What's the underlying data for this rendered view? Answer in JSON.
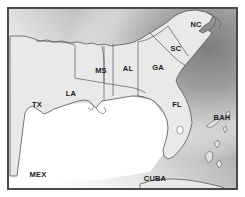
{
  "figure": {
    "kind": "reference-map",
    "width": 245,
    "height": 197
  },
  "colors": {
    "page_background": "#ffffff",
    "frame_border": "#4a4a4a",
    "land_fill": "#e9e9e9",
    "land_outline": "#555555",
    "state_border": "#5a5a5a",
    "gulf_water": "#ffffff",
    "atlantic_deep": "#8d8d8d",
    "atlantic_shallow": "#ffffff",
    "label_text": "#1a1a1a"
  },
  "frame": {
    "x": 8,
    "y": 8,
    "width": 229,
    "height": 181,
    "stroke_width": 2
  },
  "labels": [
    {
      "id": "label-nc",
      "text": "NC",
      "x": 196,
      "y": 27,
      "size": 7.5
    },
    {
      "id": "label-sc",
      "text": "SC",
      "x": 176,
      "y": 51,
      "size": 7.5
    },
    {
      "id": "label-ms",
      "text": "MS",
      "x": 101,
      "y": 73,
      "size": 7.5
    },
    {
      "id": "label-al",
      "text": "AL",
      "x": 128,
      "y": 71,
      "size": 7.5
    },
    {
      "id": "label-ga",
      "text": "GA",
      "x": 158,
      "y": 70,
      "size": 7.5
    },
    {
      "id": "label-la",
      "text": "LA",
      "x": 71,
      "y": 96,
      "size": 7.5
    },
    {
      "id": "label-tx",
      "text": "TX",
      "x": 37,
      "y": 107,
      "size": 7.5
    },
    {
      "id": "label-fl",
      "text": "FL",
      "x": 177,
      "y": 107,
      "size": 7.5
    },
    {
      "id": "label-bah",
      "text": "BAH",
      "x": 222,
      "y": 120,
      "size": 7.5
    },
    {
      "id": "label-mex",
      "text": "MEX",
      "x": 38,
      "y": 177,
      "size": 7.5
    },
    {
      "id": "label-cuba",
      "text": "CUBA",
      "x": 155,
      "y": 181,
      "size": 7.5
    }
  ],
  "regions": {
    "mainland_outline": "M 10 36 L 24 36 L 32 38 L 40 41 L 47 40 L 54 42 L 62 41 L 70 43 L 78 42 L 86 44 L 92 43 L 98 45 L 104 44 L 112 46 L 118 45 L 126 44 L 134 42 L 142 38 L 150 33 L 158 28 L 166 23 L 172 18 L 178 14 L 186 11 L 196 10 L 206 12 L 213 16 L 210 22 L 204 26 L 199 31 L 203 33 L 208 30 L 212 33 L 208 38 L 203 44 L 198 50 L 193 56 L 188 62 L 183 68 L 179 74 L 176 80 L 178 86 L 182 92 L 186 99 L 189 107 L 191 115 L 192 123 L 190 131 L 187 139 L 183 146 L 178 152 L 173 157 L 168 159 L 164 156 L 163 150 L 165 143 L 167 136 L 168 128 L 167 120 L 164 113 L 160 107 L 155 102 L 150 99 L 144 97 L 138 96 L 132 96 L 126 97 L 120 98 L 114 99 L 108 100 L 102 101 L 99 104 L 96 108 L 93 105 L 89 101 L 84 100 L 78 101 L 72 103 L 66 105 L 60 107 L 54 109 L 49 112 L 44 114 L 40 111 L 36 108 L 32 106 L 28 108 L 25 113 L 24 120 L 23 128 L 22 136 L 21 144 L 20 152 L 19 160 L 18 168 L 17 176 L 10 176 Z",
    "florida_peninsula": "M 150 99 L 155 102 L 160 107 L 164 113 L 167 120 L 168 128 L 167 136 L 165 143 L 163 150 L 164 156 L 168 159 L 173 157 L 178 152 L 183 146 L 187 139 L 190 131 L 192 123 L 191 115 L 189 107 L 186 99 L 182 92 L 178 86 L 176 80 Z",
    "cuba": "M 140 184 L 150 181 L 162 179 L 175 179 L 188 180 L 200 182 L 210 184 L 218 186 L 224 188 L 224 189 L 140 189 Z",
    "mexico_shelf": "M 10 150 L 18 150 L 20 158 L 19 166 L 18 174 L 17 181 L 10 181 Z",
    "state_borders": [
      "M 75 78 L 80 79 L 86 80 L 92 81 L 98 82 L 104 83 L 104 60 L 103 52 L 102 46",
      "M 104 46 L 104 100",
      "M 113 44 L 113 96",
      "M 138 42 L 138 96 L 144 97",
      "M 138 42 L 146 40 L 154 36 L 162 31 L 168 26",
      "M 168 26 L 172 32 L 176 38 L 180 44 L 184 50 L 188 56",
      "M 150 33 L 156 39 L 162 45 L 168 51 L 174 57 L 180 62 L 186 66",
      "M 75 45 L 75 78",
      "M 36 41 L 44 41 L 52 42 L 60 42 L 68 43 L 75 45",
      "M 104 83 L 110 84 L 116 85 L 122 86 L 128 87 L 134 88 L 140 90 L 146 93"
    ],
    "bahamas_islands": [
      "M 206 126 L 212 122 L 217 119 L 220 120 L 216 124 L 210 128 Z",
      "M 223 128 L 226 126 L 227 130 L 225 133 Z",
      "M 214 143 L 218 140 L 220 144 L 217 148 Z",
      "M 205 156 L 209 151 L 213 153 L 212 160 L 208 163 Z",
      "M 216 163 L 220 160 L 222 165 L 219 168 Z",
      "M 226 113 L 229 111 L 230 115 L 227 117 Z"
    ],
    "lake_okeechobee": {
      "cx": 180,
      "cy": 130,
      "rx": 3.2,
      "ry": 4.0
    },
    "coastal_detail": [
      "M 96 108 L 99 112 L 103 114 L 106 111 L 104 107",
      "M 90 103 L 94 106 L 92 110 L 88 108"
    ],
    "outer_banks": [
      "M 206 12 L 212 15 L 216 20 L 214 26 L 209 30",
      "M 213 16 L 218 19 L 221 24 L 219 29"
    ]
  }
}
